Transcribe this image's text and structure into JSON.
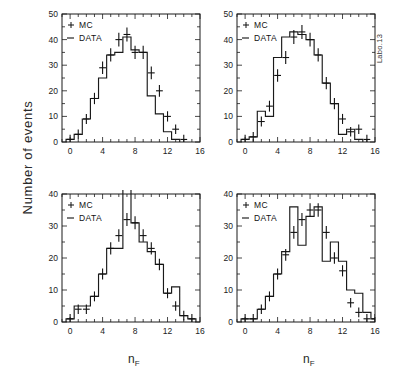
{
  "figure": {
    "ylabel": "Number of events",
    "corner_note": "Labo.13",
    "xlabel": "n",
    "xlabel_sub": "F"
  },
  "legend": {
    "mc_marker": "+",
    "mc_label": "MC",
    "data_marker": "–",
    "data_label": "DATA"
  },
  "axes": {
    "x_ticks": [
      "0",
      "4",
      "8",
      "12",
      "16"
    ],
    "y_ticks_50": [
      "0",
      "10",
      "20",
      "30",
      "40",
      "50"
    ],
    "y_ticks_40": [
      "0",
      "10",
      "20",
      "30",
      "40"
    ]
  },
  "chart_data": [
    {
      "type": "bar",
      "panel": "top-left",
      "title": "",
      "xlabel": "n_F",
      "ylabel": "Number of events",
      "xlim": [
        -1,
        16
      ],
      "ylim": [
        0,
        50
      ],
      "grid": false,
      "legend": [
        "MC",
        "DATA"
      ],
      "legend_position": "top-left",
      "x": [
        0,
        1,
        2,
        3,
        4,
        5,
        6,
        7,
        8,
        9,
        10,
        11,
        12,
        13
      ],
      "series": [
        {
          "name": "DATA",
          "style": "histogram-step",
          "values": [
            1,
            3,
            9,
            17,
            25,
            34,
            35,
            41,
            36,
            35,
            18,
            11,
            4,
            1
          ]
        },
        {
          "name": "MC",
          "style": "points-with-errorbars",
          "values": [
            1,
            3,
            9,
            17,
            29,
            34,
            40,
            42,
            35,
            35,
            27,
            20,
            10,
            5,
            1
          ]
        }
      ]
    },
    {
      "type": "bar",
      "panel": "top-right",
      "title": "",
      "xlabel": "n_F",
      "ylabel": "Number of events",
      "xlim": [
        -1,
        16
      ],
      "ylim": [
        0,
        50
      ],
      "grid": false,
      "legend": [
        "MC",
        "DATA"
      ],
      "legend_position": "top-left",
      "x": [
        0,
        1,
        2,
        3,
        4,
        5,
        6,
        7,
        8,
        9,
        10,
        11,
        12,
        13,
        14
      ],
      "series": [
        {
          "name": "DATA",
          "style": "histogram-step",
          "values": [
            1,
            2,
            12,
            10,
            33,
            41,
            43,
            42,
            40,
            34,
            23,
            15,
            3,
            5,
            1
          ]
        },
        {
          "name": "MC",
          "style": "points-with-errorbars",
          "values": [
            1,
            2,
            8,
            14,
            26,
            33,
            41,
            43,
            40,
            34,
            23,
            15,
            9,
            4,
            5,
            1
          ]
        }
      ]
    },
    {
      "type": "bar",
      "panel": "bottom-left",
      "title": "",
      "xlabel": "n_F",
      "ylabel": "Number of events",
      "xlim": [
        -1,
        16
      ],
      "ylim": [
        0,
        40
      ],
      "grid": false,
      "legend": [
        "MC",
        "DATA"
      ],
      "legend_position": "top-left",
      "x": [
        0,
        1,
        2,
        3,
        4,
        5,
        6,
        7,
        8,
        9,
        10,
        11,
        12,
        13,
        14
      ],
      "series": [
        {
          "name": "DATA",
          "style": "histogram-step",
          "values": [
            1,
            5,
            5,
            8,
            15,
            23,
            23,
            42,
            31,
            25,
            22,
            18,
            9,
            11,
            2,
            1
          ]
        },
        {
          "name": "MC",
          "style": "points-with-errorbars",
          "values": [
            1,
            4,
            4,
            8,
            15,
            23,
            27,
            32,
            31,
            27,
            23,
            18,
            9,
            5,
            2,
            1
          ]
        }
      ]
    },
    {
      "type": "bar",
      "panel": "bottom-right",
      "title": "",
      "xlabel": "n_F",
      "ylabel": "Number of events",
      "xlim": [
        -1,
        16
      ],
      "ylim": [
        0,
        40
      ],
      "grid": false,
      "legend": [
        "MC",
        "DATA"
      ],
      "legend_position": "top-left",
      "x": [
        0,
        1,
        2,
        3,
        4,
        5,
        6,
        7,
        8,
        9,
        10,
        11,
        12,
        13,
        14,
        15
      ],
      "series": [
        {
          "name": "DATA",
          "style": "histogram-step",
          "values": [
            1,
            1,
            4,
            8,
            15,
            22,
            36,
            24,
            33,
            36,
            19,
            25,
            19,
            10,
            9,
            3,
            1
          ]
        },
        {
          "name": "MC",
          "style": "points-with-errorbars",
          "values": [
            1,
            1,
            4,
            8,
            15,
            21,
            28,
            32,
            35,
            35,
            28,
            20,
            16,
            6,
            3,
            1,
            1
          ]
        }
      ]
    }
  ]
}
